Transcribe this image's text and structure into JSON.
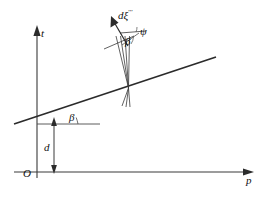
{
  "figure": {
    "background_color": "#ffffff",
    "line_color": "#333333",
    "text_color": "#111111"
  },
  "axes": {
    "vertical": {
      "label": "t",
      "name": "t-axis",
      "x": 37,
      "y_top": 28,
      "y_bottom": 178
    },
    "horizontal": {
      "label": "p",
      "name": "p-axis",
      "y": 172,
      "x_left": 14,
      "x_right": 252
    },
    "origin": {
      "label": "O",
      "x": 37,
      "y": 172
    }
  },
  "inclined_line": {
    "name": "sinusoid-trace-line",
    "x1": 14,
    "y1": 124,
    "x2": 216,
    "y2": 57,
    "description": "straight line rising to the right crossing the t-axis"
  },
  "angles": {
    "theta": {
      "label": "β",
      "name": "angle-beta-baseline",
      "vertex_x": 50,
      "vertex_y": 112
    },
    "beta": {
      "label": "β",
      "name": "angle-beta-upper"
    },
    "psi": {
      "label": "ψ",
      "name": "angle-psi"
    }
  },
  "dimension": {
    "label": "d",
    "name": "distance-d",
    "x": 54,
    "y_top": 119,
    "y_bottom": 172
  },
  "vector": {
    "label": "dξ",
    "superscript": "′′′",
    "name": "vector-d-xi",
    "tip_x": 112,
    "tip_y": 17,
    "tail_x": 128,
    "tail_y": 45
  },
  "intersection": {
    "name": "fan-convergence-point",
    "x": 128,
    "y": 88,
    "description": "point where several nearly-parallel rays converge on the inclined line"
  }
}
